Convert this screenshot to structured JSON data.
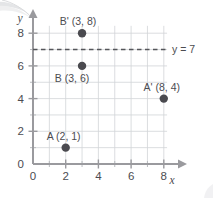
{
  "figure": {
    "kind": "coordinate-plane-diagram",
    "background_color": "#ffffff",
    "point_color": "#4a4a4f",
    "grid_color": "#d2d4d8",
    "axis_color": "#9a9a9e",
    "dash_color": "#55565a"
  },
  "axes": {
    "x": {
      "name": "x",
      "ticklabels": [
        "0",
        "2",
        "4",
        "6",
        "8"
      ],
      "tickvalues": [
        0,
        2,
        4,
        6,
        8
      ],
      "min": 0,
      "max": 9,
      "minor_step": 1
    },
    "y": {
      "name": "y",
      "ticklabels": [
        "0",
        "2",
        "4",
        "6",
        "8"
      ],
      "tickvalues": [
        0,
        2,
        4,
        6,
        8
      ],
      "min": 0,
      "max": 8.6,
      "minor_step": 1
    }
  },
  "points": [
    {
      "id": "A",
      "label": "A (2, 1)",
      "x": 2,
      "y": 1,
      "label_dx": -2,
      "label_dy": -8
    },
    {
      "id": "Ap",
      "label": "A' (8, 4)",
      "x": 8,
      "y": 4,
      "label_dx": -2,
      "label_dy": -8
    },
    {
      "id": "B",
      "label": "B (3, 6)",
      "x": 3,
      "y": 6,
      "label_dx": -10,
      "label_dy": 16
    },
    {
      "id": "Bp",
      "label": "B' (3, 8)",
      "x": 3,
      "y": 8,
      "label_dx": -4,
      "label_dy": -8
    }
  ],
  "reference_line": {
    "label": "y = 7",
    "y": 7,
    "style": "dashed",
    "x_start": 0,
    "x_end": 8.2
  },
  "chart_data": {
    "type": "scatter",
    "title": "",
    "xlabel": "x",
    "ylabel": "y",
    "xlim": [
      0,
      9
    ],
    "ylim": [
      0,
      8.6
    ],
    "grid": true,
    "legend": "none",
    "x": [
      2,
      8,
      3,
      3
    ],
    "y": [
      1,
      4,
      6,
      8
    ],
    "labels": [
      "A (2, 1)",
      "A' (8, 4)",
      "B (3, 6)",
      "B' (3, 8)"
    ],
    "annotations": [
      "y = 7"
    ]
  }
}
